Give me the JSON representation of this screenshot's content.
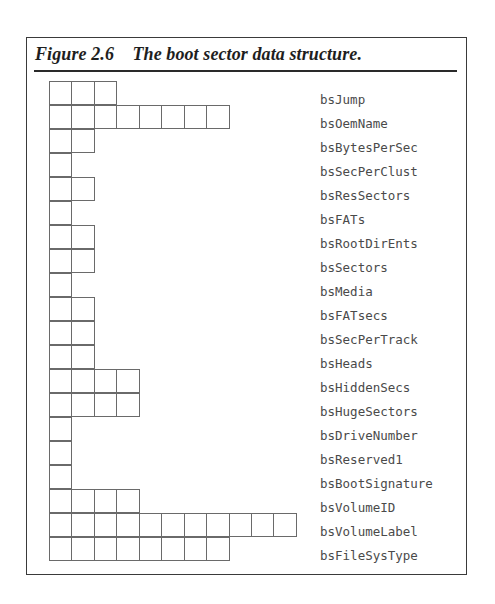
{
  "figure": {
    "number": "Figure 2.6",
    "caption": "The boot sector data structure."
  },
  "fields": [
    {
      "name": "bsJump",
      "bytes": 3
    },
    {
      "name": "bsOemName",
      "bytes": 8
    },
    {
      "name": "bsBytesPerSec",
      "bytes": 2
    },
    {
      "name": "bsSecPerClust",
      "bytes": 1
    },
    {
      "name": "bsResSectors",
      "bytes": 2
    },
    {
      "name": "bsFATs",
      "bytes": 1
    },
    {
      "name": "bsRootDirEnts",
      "bytes": 2
    },
    {
      "name": "bsSectors",
      "bytes": 2
    },
    {
      "name": "bsMedia",
      "bytes": 1
    },
    {
      "name": "bsFATsecs",
      "bytes": 2
    },
    {
      "name": "bsSecPerTrack",
      "bytes": 2
    },
    {
      "name": "bsHeads",
      "bytes": 2
    },
    {
      "name": "bsHiddenSecs",
      "bytes": 4
    },
    {
      "name": "bsHugeSectors",
      "bytes": 4
    },
    {
      "name": "bsDriveNumber",
      "bytes": 1
    },
    {
      "name": "bsReserved1",
      "bytes": 1
    },
    {
      "name": "bsBootSignature",
      "bytes": 1
    },
    {
      "name": "bsVolumeID",
      "bytes": 4
    },
    {
      "name": "bsVolumeLabel",
      "bytes": 11
    },
    {
      "name": "bsFileSysType",
      "bytes": 8
    }
  ]
}
